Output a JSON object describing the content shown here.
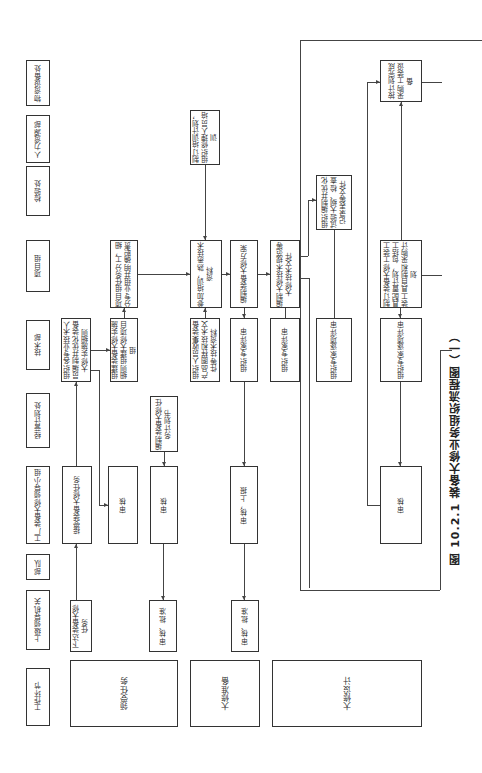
{
  "caption": "图 10.2.1  装备大修业务组织流程图（一）",
  "headers": [
    "工作环节",
    "上级领导机关",
    "部队",
    "工厂装备大修领导小组",
    "经营计划处",
    "技术部",
    "项目组",
    "检验处",
    "人力资源部",
    "物资设备处"
  ],
  "stages": [
    "领受任务",
    "大修准备",
    "大修设计"
  ],
  "nodes": {
    "issue_task": "下达装备大修任务",
    "accept_task": "接受装备大修任务",
    "org_tech_staff": "组织各专业技术人员编制并优化装备大修实施细则",
    "review_1": "审核",
    "approve_1": "审核、批准",
    "form_team": "组建装备大修实施细则组建大修项目组",
    "split_tasks": "项目组任务分工，细分专业组并明确职责",
    "plan_book": "编制装备大修任务计划书",
    "review_2": "审核",
    "approve_2": "审核、批准",
    "collect_docs": "组织人员收集装备产品图样和技术文件等技术资料",
    "train_plan": "制订培训计划，组织修理人员培训",
    "familiarize": "参加培训，熟悉技术资料",
    "compile_plan": "编制装备大修方案",
    "expert_review_1": "组织专家评审",
    "review_report": "审核，上报",
    "compile_spec": "编制大修技术规范等大修技术文件",
    "expert_review_2": "组织专家评审",
    "test_outline": "组织编制并优化试验大纲、检查记录表等文件",
    "expert_review_3": "组织专家逐项评审",
    "tooling_plan": "制订装备大修工装工具配置计划，包括工装工具自制和采购计划",
    "expert_review_4": "组织专家逐项评审",
    "review_3": "审核",
    "procure": "按计划完成采购工装设备"
  }
}
